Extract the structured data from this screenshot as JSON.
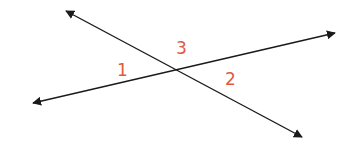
{
  "diagram": {
    "line_color": "#1a1a1a",
    "label_color": "#e05a3a",
    "intersection": {
      "x": 178,
      "y": 70
    },
    "lines": [
      {
        "name": "line-a",
        "from": {
          "x": 66,
          "y": 11
        },
        "to": {
          "x": 302,
          "y": 137
        }
      },
      {
        "name": "line-b",
        "from": {
          "x": 33,
          "y": 103
        },
        "to": {
          "x": 335,
          "y": 33
        }
      }
    ],
    "labels": [
      {
        "text": "1",
        "x": 122,
        "y": 76
      },
      {
        "text": "3",
        "x": 181,
        "y": 54
      },
      {
        "text": "2",
        "x": 230,
        "y": 85
      }
    ]
  }
}
